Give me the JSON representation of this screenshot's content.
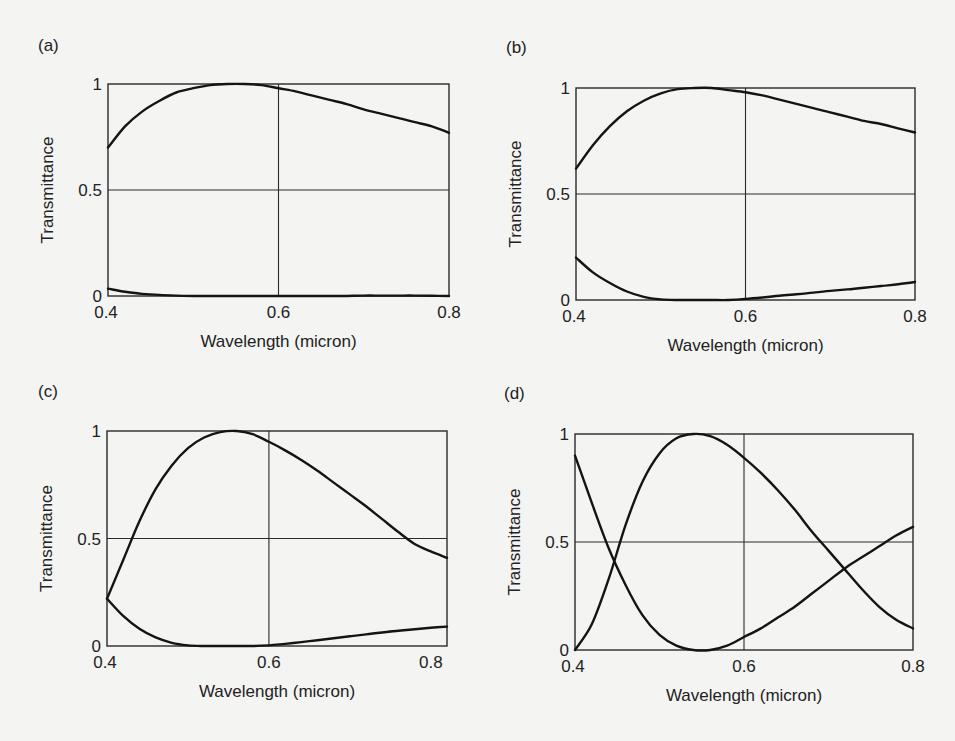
{
  "figure": {
    "panels": [
      {
        "id": "a",
        "label": "(a)",
        "xlabel": "Wavelength (micron)",
        "ylabel": "Transmittance",
        "xticks": [
          "0.4",
          "0.6",
          "0.8"
        ],
        "yticks": [
          "0",
          "0.5",
          "1"
        ]
      },
      {
        "id": "b",
        "label": "(b)",
        "xlabel": "Wavelength (micron)",
        "ylabel": "Transmittance",
        "xticks": [
          "0.4",
          "0.6",
          "0.8"
        ],
        "yticks": [
          "0",
          "0.5",
          "1"
        ]
      },
      {
        "id": "c",
        "label": "(c)",
        "xlabel": "Wavelength (micron)",
        "ylabel": "Transmittance",
        "xticks": [
          "0.4",
          "0.6",
          "0.8"
        ],
        "yticks": [
          "0",
          "0.5",
          "1"
        ]
      },
      {
        "id": "d",
        "label": "(d)",
        "xlabel": "Wavelength (micron)",
        "ylabel": "Transmittance",
        "xticks": [
          "0.4",
          "0.6",
          "0.8"
        ],
        "yticks": [
          "0",
          "0.5",
          "1"
        ]
      }
    ]
  },
  "chart_data": [
    {
      "panel": "(a)",
      "type": "line",
      "title": "",
      "xlabel": "Wavelength (micron)",
      "ylabel": "Transmittance",
      "xlim": [
        0.4,
        0.8
      ],
      "ylim": [
        0,
        1
      ],
      "xticks": [
        0.4,
        0.6,
        0.8
      ],
      "yticks": [
        0,
        0.5,
        1
      ],
      "grid": {
        "x": [
          0.6
        ],
        "y": [
          0.5
        ]
      },
      "x": [
        0.4,
        0.42,
        0.44,
        0.46,
        0.48,
        0.5,
        0.52,
        0.54,
        0.56,
        0.58,
        0.6,
        0.62,
        0.64,
        0.66,
        0.68,
        0.7,
        0.72,
        0.74,
        0.76,
        0.78,
        0.8
      ],
      "series": [
        {
          "name": "T_max",
          "values": [
            0.7,
            0.8,
            0.87,
            0.92,
            0.96,
            0.98,
            0.995,
            1.0,
            1.0,
            0.995,
            0.98,
            0.965,
            0.945,
            0.925,
            0.905,
            0.88,
            0.86,
            0.84,
            0.82,
            0.8,
            0.77
          ]
        },
        {
          "name": "T_min",
          "values": [
            0.035,
            0.02,
            0.01,
            0.005,
            0.002,
            0.0,
            0.0,
            0.0,
            0.0,
            0.0,
            0.0,
            0.0,
            0.0,
            0.0,
            0.0,
            0.002,
            0.002,
            0.002,
            0.002,
            0.001,
            0.0
          ]
        }
      ]
    },
    {
      "panel": "(b)",
      "type": "line",
      "title": "",
      "xlabel": "Wavelength (micron)",
      "ylabel": "Transmittance",
      "xlim": [
        0.4,
        0.8
      ],
      "ylim": [
        0,
        1
      ],
      "xticks": [
        0.4,
        0.6,
        0.8
      ],
      "yticks": [
        0,
        0.5,
        1
      ],
      "grid": {
        "x": [
          0.6
        ],
        "y": [
          0.5
        ]
      },
      "x": [
        0.4,
        0.42,
        0.44,
        0.46,
        0.48,
        0.5,
        0.52,
        0.54,
        0.56,
        0.58,
        0.6,
        0.62,
        0.64,
        0.66,
        0.68,
        0.7,
        0.72,
        0.74,
        0.76,
        0.78,
        0.8
      ],
      "series": [
        {
          "name": "T_max",
          "values": [
            0.62,
            0.73,
            0.82,
            0.89,
            0.94,
            0.975,
            0.995,
            1.0,
            1.0,
            0.99,
            0.98,
            0.965,
            0.945,
            0.925,
            0.905,
            0.885,
            0.865,
            0.845,
            0.83,
            0.81,
            0.79
          ]
        },
        {
          "name": "T_min",
          "values": [
            0.2,
            0.13,
            0.08,
            0.04,
            0.015,
            0.003,
            0.0,
            0.0,
            0.0,
            0.0,
            0.005,
            0.012,
            0.02,
            0.027,
            0.035,
            0.043,
            0.05,
            0.058,
            0.066,
            0.074,
            0.085
          ]
        }
      ]
    },
    {
      "panel": "(c)",
      "type": "line",
      "title": "",
      "xlabel": "Wavelength (micron)",
      "ylabel": "Transmittance",
      "xlim": [
        0.4,
        0.82
      ],
      "ylim": [
        0,
        1
      ],
      "xticks": [
        0.4,
        0.6,
        0.8
      ],
      "yticks": [
        0,
        0.5,
        1
      ],
      "grid": {
        "x": [
          0.6
        ],
        "y": [
          0.5
        ]
      },
      "x": [
        0.4,
        0.42,
        0.44,
        0.46,
        0.48,
        0.5,
        0.52,
        0.54,
        0.56,
        0.58,
        0.6,
        0.62,
        0.64,
        0.66,
        0.68,
        0.7,
        0.72,
        0.74,
        0.76,
        0.78,
        0.8,
        0.82
      ],
      "series": [
        {
          "name": "T_max",
          "values": [
            0.22,
            0.4,
            0.58,
            0.73,
            0.84,
            0.92,
            0.97,
            0.995,
            1.0,
            0.985,
            0.95,
            0.91,
            0.865,
            0.815,
            0.76,
            0.705,
            0.65,
            0.59,
            0.53,
            0.475,
            0.44,
            0.41
          ]
        },
        {
          "name": "T_min",
          "values": [
            0.22,
            0.14,
            0.08,
            0.04,
            0.015,
            0.003,
            0.0,
            0.0,
            0.0,
            0.0,
            0.003,
            0.01,
            0.018,
            0.027,
            0.036,
            0.045,
            0.054,
            0.063,
            0.071,
            0.078,
            0.085,
            0.09
          ]
        }
      ]
    },
    {
      "panel": "(d)",
      "type": "line",
      "title": "",
      "xlabel": "Wavelength (micron)",
      "ylabel": "Transmittance",
      "xlim": [
        0.4,
        0.8
      ],
      "ylim": [
        0,
        1
      ],
      "xticks": [
        0.4,
        0.6,
        0.8
      ],
      "yticks": [
        0,
        0.5,
        1
      ],
      "grid": {
        "x": [
          0.6
        ],
        "y": [
          0.5
        ]
      },
      "x": [
        0.4,
        0.42,
        0.44,
        0.46,
        0.48,
        0.5,
        0.52,
        0.54,
        0.56,
        0.58,
        0.6,
        0.62,
        0.64,
        0.66,
        0.68,
        0.7,
        0.72,
        0.74,
        0.76,
        0.78,
        0.8
      ],
      "series": [
        {
          "name": "T_max",
          "values": [
            0.0,
            0.12,
            0.33,
            0.58,
            0.78,
            0.91,
            0.98,
            1.0,
            0.99,
            0.95,
            0.89,
            0.82,
            0.74,
            0.65,
            0.55,
            0.46,
            0.37,
            0.28,
            0.2,
            0.14,
            0.1
          ]
        },
        {
          "name": "T_min",
          "values": [
            0.9,
            0.68,
            0.47,
            0.3,
            0.16,
            0.07,
            0.02,
            0.0,
            0.0,
            0.02,
            0.06,
            0.1,
            0.15,
            0.2,
            0.26,
            0.32,
            0.38,
            0.43,
            0.48,
            0.53,
            0.57
          ]
        }
      ]
    }
  ]
}
